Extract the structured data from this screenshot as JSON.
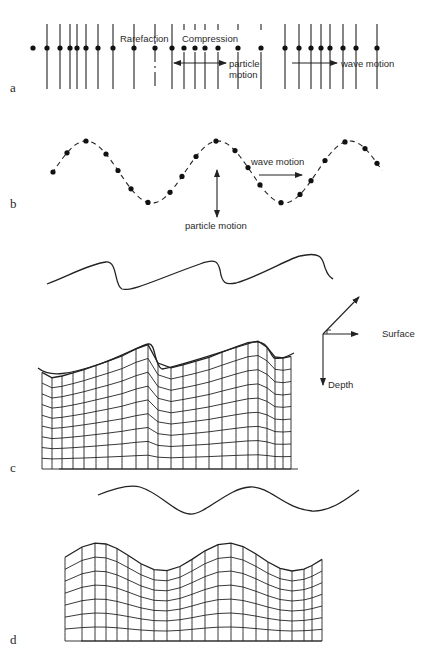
{
  "figure": {
    "parts": {
      "a": {
        "label": "a",
        "title": "Longitudinal (compressional) wave",
        "annotations": {
          "rarefaction": "Rarefaction",
          "compression": "Compression",
          "particle_motion_1": "particle",
          "particle_motion_2": "motion",
          "wave_motion": "wave motion"
        },
        "particle_x": [
          33,
          47,
          60,
          70,
          77,
          86,
          98,
          113,
          134,
          155,
          172,
          184,
          195,
          205,
          218,
          238,
          261,
          285,
          299,
          311,
          321,
          330,
          343,
          356,
          377
        ],
        "dashed_indices": [
          9
        ],
        "short_indices": [
          11,
          12,
          13,
          14,
          15,
          16
        ]
      },
      "b": {
        "label": "b",
        "title": "Transverse (shear) wave",
        "annotations": {
          "wave_motion": "wave motion",
          "particle_motion": "particle motion"
        }
      },
      "c": {
        "label": "c",
        "title": "Rayleigh wave",
        "axes": {
          "surface": "Surface",
          "depth": "Depth"
        }
      },
      "d": {
        "label": "d",
        "title": "Love / surface wave deformation"
      }
    },
    "colors": {
      "ink": "#222222",
      "background": "#ffffff"
    }
  }
}
